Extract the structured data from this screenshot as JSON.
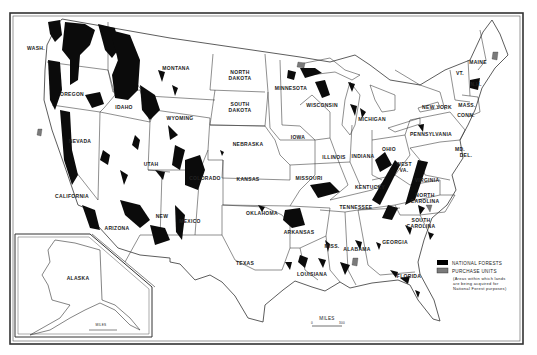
{
  "map": {
    "title": "National Forests and Purchase Units of the United States",
    "states": [
      {
        "name": "WASH.",
        "x": 36,
        "y": 50
      },
      {
        "name": "OREGON",
        "x": 72,
        "y": 96
      },
      {
        "name": "CALIFORNIA",
        "x": 72,
        "y": 198
      },
      {
        "name": "NEVADA",
        "x": 80,
        "y": 143
      },
      {
        "name": "IDAHO",
        "x": 124,
        "y": 109
      },
      {
        "name": "MONTANA",
        "x": 176,
        "y": 70
      },
      {
        "name": "WYOMING",
        "x": 180,
        "y": 120
      },
      {
        "name": "UTAH",
        "x": 151,
        "y": 166
      },
      {
        "name": "COLORADO",
        "x": 205,
        "y": 180
      },
      {
        "name": "ARIZONA",
        "x": 117,
        "y": 230
      },
      {
        "name": "NEW",
        "x": 162,
        "y": 218
      },
      {
        "name": "MEXICO",
        "x": 190,
        "y": 223
      },
      {
        "name": "NORTH",
        "x": 240,
        "y": 74
      },
      {
        "name": "DAKOTA",
        "x": 240,
        "y": 80
      },
      {
        "name": "SOUTH",
        "x": 240,
        "y": 106
      },
      {
        "name": "DAKOTA",
        "x": 240,
        "y": 112
      },
      {
        "name": "NEBRASKA",
        "x": 248,
        "y": 146
      },
      {
        "name": "KANSAS",
        "x": 248,
        "y": 181
      },
      {
        "name": "OKLAHOMA",
        "x": 262,
        "y": 215
      },
      {
        "name": "TEXAS",
        "x": 245,
        "y": 265
      },
      {
        "name": "MINNESOTA",
        "x": 291,
        "y": 90
      },
      {
        "name": "IOWA",
        "x": 298,
        "y": 139
      },
      {
        "name": "MISSOURI",
        "x": 309,
        "y": 180
      },
      {
        "name": "ARKANSAS",
        "x": 299,
        "y": 234
      },
      {
        "name": "LOUISIANA",
        "x": 312,
        "y": 276
      },
      {
        "name": "WISCONSIN",
        "x": 322,
        "y": 107
      },
      {
        "name": "ILLINOIS",
        "x": 334,
        "y": 159
      },
      {
        "name": "MICHIGAN",
        "x": 372,
        "y": 121
      },
      {
        "name": "INDIANA",
        "x": 363,
        "y": 158
      },
      {
        "name": "OHIO",
        "x": 389,
        "y": 151
      },
      {
        "name": "KENTUCKY",
        "x": 370,
        "y": 189
      },
      {
        "name": "TENNESSEE",
        "x": 356,
        "y": 209
      },
      {
        "name": "MISS.",
        "x": 332,
        "y": 248
      },
      {
        "name": "ALABAMA",
        "x": 357,
        "y": 251
      },
      {
        "name": "GEORGIA",
        "x": 395,
        "y": 244
      },
      {
        "name": "FLORIDA",
        "x": 409,
        "y": 278
      },
      {
        "name": "SOUTH",
        "x": 421,
        "y": 222
      },
      {
        "name": "CAROLINA",
        "x": 421,
        "y": 228
      },
      {
        "name": "NORTH",
        "x": 425,
        "y": 197
      },
      {
        "name": "CAROLINA",
        "x": 425,
        "y": 203
      },
      {
        "name": "VIRGINIA",
        "x": 427,
        "y": 182
      },
      {
        "name": "WEST",
        "x": 404,
        "y": 166
      },
      {
        "name": "VA.",
        "x": 404,
        "y": 172
      },
      {
        "name": "PENNSYLVANIA",
        "x": 431,
        "y": 136
      },
      {
        "name": "NEW YORK",
        "x": 437,
        "y": 109
      },
      {
        "name": "MASS.",
        "x": 467,
        "y": 107
      },
      {
        "name": "CONN.",
        "x": 466,
        "y": 117
      },
      {
        "name": "VT.",
        "x": 460,
        "y": 75
      },
      {
        "name": "N.H.",
        "x": 476,
        "y": 86
      },
      {
        "name": "MAINE",
        "x": 478,
        "y": 64
      },
      {
        "name": "MD.",
        "x": 460,
        "y": 151
      },
      {
        "name": "DEL.",
        "x": 466,
        "y": 157
      },
      {
        "name": "ALASKA",
        "x": 78,
        "y": 280
      }
    ],
    "scale_bar": {
      "label": "MILES",
      "start": "0",
      "end": "300"
    },
    "inset_scale_bar": {
      "label": "MILES",
      "start": "0",
      "end": "500"
    }
  },
  "legend": {
    "items": [
      {
        "label": "NATIONAL FORESTS",
        "color": "#000000"
      },
      {
        "label": "PURCHASE UNITS",
        "color": "#7a7a7a"
      }
    ],
    "note_lines": [
      "(Areas within which lands",
      "are being acquired for",
      "National Forest purposes)"
    ]
  },
  "colors": {
    "forest": "#0b0b0b",
    "purchase": "#7a7a7a",
    "border": "#333333",
    "paper": "#ffffff"
  }
}
